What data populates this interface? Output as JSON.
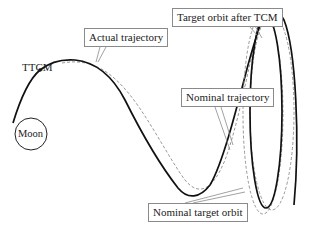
{
  "diagram": {
    "labels": {
      "ttcm": "TTCM",
      "moon": "Moon",
      "actual_trajectory": "Actual trajectory",
      "target_orbit_after_tcm": "Target orbit after TCM",
      "nominal_trajectory": "Nominal trajectory",
      "nominal_target_orbit": "Nominal target orbit"
    },
    "legend_styles": {
      "actual": "solid bold black line",
      "nominal": "dashed gray line"
    },
    "colors": {
      "actual_line": "#111111",
      "nominal_line": "#8c8c8c",
      "callout_border": "#8a8a8a",
      "background": "#ffffff"
    }
  }
}
